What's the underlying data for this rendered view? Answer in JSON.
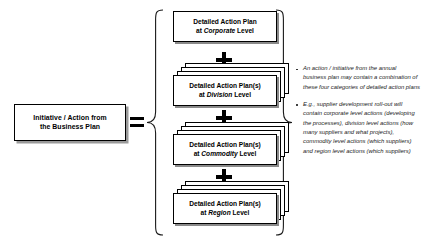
{
  "diagram": {
    "type": "equation-diagram",
    "left_side": {
      "box_label": "Initiative / Action from\nthe Business Plan"
    },
    "operator_equals": "=",
    "operator_plus": "+",
    "right_side": {
      "plans": [
        {
          "id": "corporate",
          "line1": "Detailed Action Plan",
          "line2_prefix": "at ",
          "level": "Corporate",
          "line2_suffix": " Level",
          "stacked": false,
          "stack_count": 1
        },
        {
          "id": "division",
          "line1": "Detailed Action Plan(s)",
          "line2_prefix": "at ",
          "level": "Division",
          "line2_suffix": " Level",
          "stacked": true,
          "stack_count": 3
        },
        {
          "id": "commodity",
          "line1": "Detailed Action Plan(s)",
          "line2_prefix": "at ",
          "level": "Commodity",
          "line2_suffix": " Level",
          "stacked": true,
          "stack_count": 3
        },
        {
          "id": "region",
          "line1": "Detailed Action Plan(s)",
          "line2_prefix": "at ",
          "level": "Region",
          "line2_suffix": " Level",
          "stacked": true,
          "stack_count": 3
        }
      ]
    },
    "notes": [
      "An action / initiative from the annual business plan may contain a combination of these four categories of detailed action plans",
      "E.g., supplier development roll-out will contain corporate level actions (developing the processes), division level actions (how many suppliers and what projects), commodity level actions (which suppliers) and region level actions (which suppliers)"
    ],
    "colors": {
      "background": "#ffffff",
      "stroke": "#000000",
      "shadow": "#8a8a8a",
      "note_text": "#1a1a1a"
    }
  }
}
